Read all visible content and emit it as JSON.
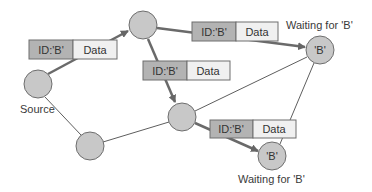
{
  "colors": {
    "background": "#ffffff",
    "node_fill": "#c8c8c8",
    "node_stroke": "#6e6e6e",
    "edge_thin": "#5e5e5e",
    "edge_thick": "#6a6a6a",
    "packet_id_fill": "#b3b3b3",
    "packet_data_fill": "#f0f0f0",
    "packet_stroke": "#6e6e6e",
    "text": "#333333"
  },
  "nodes": [
    {
      "id": "source",
      "cx": 38,
      "cy": 84,
      "r": 14,
      "label": ""
    },
    {
      "id": "top",
      "cx": 143,
      "cy": 25,
      "r": 14,
      "label": ""
    },
    {
      "id": "bottom-left",
      "cx": 90,
      "cy": 146,
      "r": 14,
      "label": ""
    },
    {
      "id": "middle",
      "cx": 182,
      "cy": 117,
      "r": 14,
      "label": ""
    },
    {
      "id": "right-receiver",
      "cx": 320,
      "cy": 50,
      "r": 14,
      "label": "'B'"
    },
    {
      "id": "bottom-receiver",
      "cx": 272,
      "cy": 156,
      "r": 14,
      "label": "'B'"
    }
  ],
  "labels": {
    "source": "Source",
    "waiting_right": "Waiting for 'B'",
    "waiting_bottom": "Waiting for 'B'"
  },
  "packets": [
    {
      "id_label": "ID:'B'",
      "data_label": "Data",
      "x": 29,
      "y": 40,
      "id_w": 44,
      "data_w": 44,
      "h": 19
    },
    {
      "id_label": "ID:'B'",
      "data_label": "Data",
      "x": 192,
      "y": 22,
      "id_w": 44,
      "data_w": 42,
      "h": 19
    },
    {
      "id_label": "ID:'B'",
      "data_label": "Data",
      "x": 143,
      "y": 61,
      "id_w": 44,
      "data_w": 43,
      "h": 19
    },
    {
      "id_label": "ID:'B'",
      "data_label": "Data",
      "x": 210,
      "y": 120,
      "id_w": 43,
      "data_w": 43,
      "h": 18
    }
  ],
  "edges": [
    {
      "from": "source",
      "to": "top",
      "style": "thick",
      "arrow": true
    },
    {
      "from": "top",
      "to": "right-receiver",
      "style": "thick",
      "arrow": true
    },
    {
      "from": "top",
      "to": "middle",
      "style": "thick",
      "arrow": true
    },
    {
      "from": "middle",
      "to": "bottom-receiver",
      "style": "thick",
      "arrow": true
    },
    {
      "from": "source",
      "to": "bottom-left",
      "style": "thin",
      "arrow": false
    },
    {
      "from": "bottom-left",
      "to": "middle",
      "style": "thin",
      "arrow": false
    },
    {
      "from": "middle",
      "to": "right-receiver",
      "style": "thin",
      "arrow": false
    },
    {
      "from": "right-receiver",
      "to": "bottom-receiver",
      "style": "thin",
      "arrow": false
    }
  ]
}
